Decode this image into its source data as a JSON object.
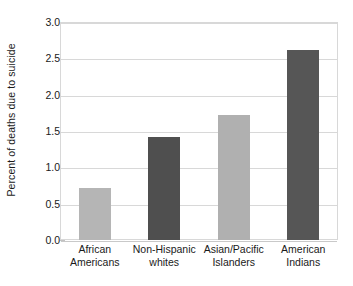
{
  "chart_data": {
    "type": "bar",
    "title": "",
    "xlabel": "",
    "ylabel": "Percent of deaths due to suicide",
    "categories": [
      "African Americans",
      "Non-Hispanic whites",
      "Asian/Pacific Islanders",
      "American Indians"
    ],
    "category_lines": [
      [
        "African",
        "Americans"
      ],
      [
        "Non-Hispanic",
        "whites"
      ],
      [
        "Asian/Pacific",
        "Islanders"
      ],
      [
        "American",
        "Indians"
      ]
    ],
    "values": [
      0.72,
      1.42,
      1.72,
      2.62
    ],
    "bar_colors": [
      "#b5b5b5",
      "#4f4f4f",
      "#b0b0b0",
      "#565656"
    ],
    "ylim": [
      0.0,
      3.0
    ],
    "yticks": [
      3.0,
      2.5,
      2.0,
      1.5,
      1.0,
      0.5,
      0.0
    ],
    "ytick_labels": [
      "3.0",
      "2.5",
      "2.0",
      "1.5",
      "1.0",
      "0.5",
      "0.0"
    ],
    "grid": true,
    "legend": "none",
    "axis_color": "#d8d8d8",
    "text_color": "#1a1a1a",
    "background": "#ffffff"
  }
}
